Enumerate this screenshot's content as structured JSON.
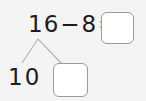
{
  "problem": {
    "equation": {
      "minuend": "16",
      "operator": "−",
      "subtrahend": "8",
      "equals": "=",
      "answer_value": ""
    },
    "number_bond": {
      "part_left_value": "10",
      "part_right_value": ""
    }
  },
  "colors": {
    "background": "#f4f4f4",
    "text": "#1c1c1c",
    "box_border": "#9a9a9a",
    "box_fill": "#ffffff",
    "bond_line": "#b5b5b5"
  }
}
